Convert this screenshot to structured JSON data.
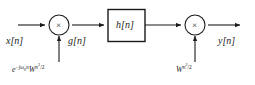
{
  "figure": {
    "type": "block-diagram",
    "domain": "signal-processing",
    "background_color": "#ffffff",
    "stroke_color": "#1a1a1a",
    "width": 255,
    "height": 85
  },
  "signals": {
    "input_label": "x[n]",
    "intermediate_label": "g[n]",
    "output_label": "y[n]"
  },
  "blocks": {
    "filter_label": "h[n]"
  },
  "multipliers": {
    "glyph": "×",
    "first_name": "multiplier-1",
    "second_name": "multiplier-2"
  },
  "modulation": {
    "left": {
      "base_e": "e",
      "exp_minus": "−",
      "exp_j": "j",
      "exp_omega": "ω",
      "exp_omega_sub": "0",
      "exp_n": "n",
      "w_base": "W",
      "w_exp_n": "n",
      "w_exp_sq": "2",
      "w_exp_div": "/2",
      "plain": "e^{-jω₀n}W^{n²/2}"
    },
    "right": {
      "w_base": "W",
      "w_exp_n": "n",
      "w_exp_sq": "2",
      "w_exp_div": "/2",
      "plain": "W^{n²/2}"
    }
  }
}
